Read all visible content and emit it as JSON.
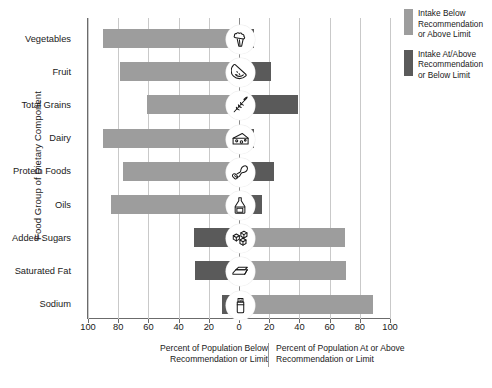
{
  "chart_data": {
    "type": "bar",
    "orientation": "horizontal",
    "subtype": "diverging-stacked",
    "title": "",
    "xlabel_left": "Percent of Population Below Recommendation or Limit",
    "xlabel_right": "Percent of Population At or Above Recommendation or Limit",
    "ylabel": "Food Group of Dietary Component",
    "xlim": [
      -100,
      100
    ],
    "xticks": [
      -100,
      -80,
      -60,
      -40,
      -20,
      0,
      20,
      40,
      60,
      80,
      100
    ],
    "xticklabels": [
      "100",
      "80",
      "60",
      "40",
      "20",
      "0",
      "20",
      "40",
      "60",
      "80",
      "100"
    ],
    "grid": true,
    "legend_position": "right",
    "categories": [
      "Vegetables",
      "Fruit",
      "Total Grains",
      "Dairy",
      "Protein Foods",
      "Oils",
      "Added Sugars",
      "Saturated Fat",
      "Sodium"
    ],
    "series": [
      {
        "name": "Intake Below Recommendation or Above Limit",
        "color": "#9d9d9d",
        "values": [
          -90,
          -79,
          -61,
          -90,
          -77,
          -85,
          70,
          71,
          89
        ]
      },
      {
        "name": "Intake At/Above Recommendation or Below Limit",
        "color": "#5a5a5a",
        "values": [
          10,
          21,
          39,
          10,
          23,
          15,
          -30,
          -29,
          -11
        ]
      }
    ],
    "icons": [
      "broccoli-icon",
      "watermelon-slice-icon",
      "wheat-stalk-icon",
      "cheese-icon",
      "chicken-drumstick-icon",
      "oil-bottle-icon",
      "sugar-cubes-icon",
      "butter-icon",
      "salt-shaker-icon"
    ]
  },
  "legend": {
    "items": [
      {
        "label": "Intake Below Recommendation or Above Limit",
        "color": "#9d9d9d"
      },
      {
        "label": "Intake At/Above Recommendation or Below Limit",
        "color": "#5a5a5a"
      }
    ]
  },
  "colors": {
    "below": "#9d9d9d",
    "at_above": "#5a5a5a",
    "grid": "#c9c9c9",
    "axis": "#6b6b6b",
    "text": "#1a1a1a",
    "background": "#ffffff"
  }
}
